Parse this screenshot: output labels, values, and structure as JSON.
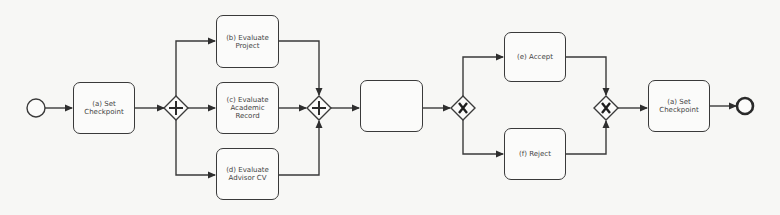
{
  "diagram": {
    "type": "BPMN process",
    "colors": {
      "stroke": "#3a3a3a",
      "fill": "#fbfbfa",
      "background": "#f7f7f5",
      "text": "#444444"
    },
    "events": [
      {
        "id": "start",
        "kind": "start-event",
        "cx": 36,
        "cy": 108,
        "r": 9
      },
      {
        "id": "end",
        "kind": "end-event",
        "cx": 745,
        "cy": 106,
        "r": 8
      }
    ],
    "gateways": [
      {
        "id": "g1",
        "kind": "parallel-split",
        "symbol": "+",
        "cx": 176,
        "cy": 108
      },
      {
        "id": "g2",
        "kind": "parallel-join",
        "symbol": "+",
        "cx": 319,
        "cy": 108
      },
      {
        "id": "g3",
        "kind": "exclusive-split",
        "symbol": "X",
        "cx": 463,
        "cy": 108
      },
      {
        "id": "g4",
        "kind": "exclusive-join",
        "symbol": "X",
        "cx": 606,
        "cy": 108
      }
    ],
    "tasks": [
      {
        "id": "a1",
        "label": "(a) Set\nCheckpoint",
        "x": 73,
        "y": 82,
        "w": 62,
        "h": 52
      },
      {
        "id": "b",
        "label": "(b) Evaluate\nProject",
        "x": 216,
        "y": 15,
        "w": 63,
        "h": 53
      },
      {
        "id": "c",
        "label": "(c) Evaluate\nAcademic\nRecord",
        "x": 216,
        "y": 82,
        "w": 63,
        "h": 52
      },
      {
        "id": "d",
        "label": "(d) Evaluate\nAdvisor CV",
        "x": 216,
        "y": 148,
        "w": 63,
        "h": 52
      },
      {
        "id": "blank",
        "label": "",
        "x": 360,
        "y": 80,
        "w": 63,
        "h": 52
      },
      {
        "id": "e",
        "label": "(e) Accept",
        "x": 504,
        "y": 32,
        "w": 62,
        "h": 50
      },
      {
        "id": "f",
        "label": "(f) Reject",
        "x": 504,
        "y": 128,
        "w": 62,
        "h": 52
      },
      {
        "id": "a2",
        "label": "(a) Set\nCheckpoint",
        "x": 648,
        "y": 80,
        "w": 62,
        "h": 52
      }
    ]
  }
}
